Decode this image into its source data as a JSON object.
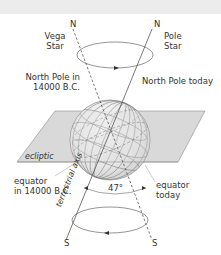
{
  "diagram": {
    "labels": {
      "north_left": "N",
      "north_right": "N",
      "vega_line1": "Vega",
      "vega_line2": "Star",
      "pole_line1": "Pole",
      "pole_line2": "Star",
      "np_past_line1": "North Pole in",
      "np_past_line2": "14000 B.C.",
      "np_today": "North Pole today",
      "ecliptic": "ecliptic",
      "eq_past_line1": "equator",
      "eq_past_line2": "in 14000  B.C.",
      "axis": "terrestrial axis",
      "angle": "47°",
      "eq_today_line1": "equator",
      "eq_today_line2": "today",
      "south_left": "S",
      "south_right": "S"
    },
    "colors": {
      "background": "#ffffff",
      "top_band": "#ececec",
      "plane_fill": "#d9d9d9",
      "plane_stroke": "#8a8a8a",
      "sphere_fill": "#ececec",
      "line": "#555555",
      "text": "#333333"
    }
  }
}
